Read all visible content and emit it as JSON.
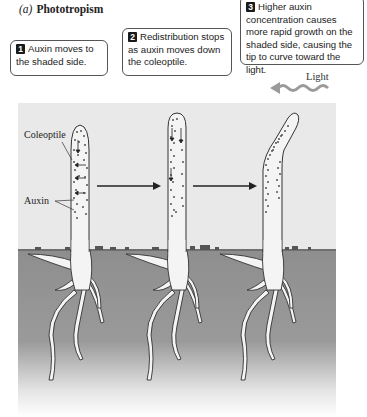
{
  "figure": {
    "panel_letter": "(a)",
    "panel_title": "Phototropism",
    "callouts": [
      {
        "step": "1",
        "text": "Auxin moves to the shaded side."
      },
      {
        "step": "2",
        "text": "Redistribution stops as auxin moves down the coleoptile."
      },
      {
        "step": "3",
        "text": "Higher auxin concentration causes more rapid growth on the shaded side, causing the tip to curve toward the light."
      }
    ],
    "light_label": "Light",
    "labels": {
      "coleoptile": "Coleoptile",
      "auxin": "Auxin"
    },
    "colors": {
      "sky": "#e9e9e9",
      "soil": "#8e8e8e",
      "plant": "#f4f4f4",
      "outline": "#333333",
      "auxin_dots": "#555555",
      "light_arrow": "#9a9a9a"
    }
  }
}
